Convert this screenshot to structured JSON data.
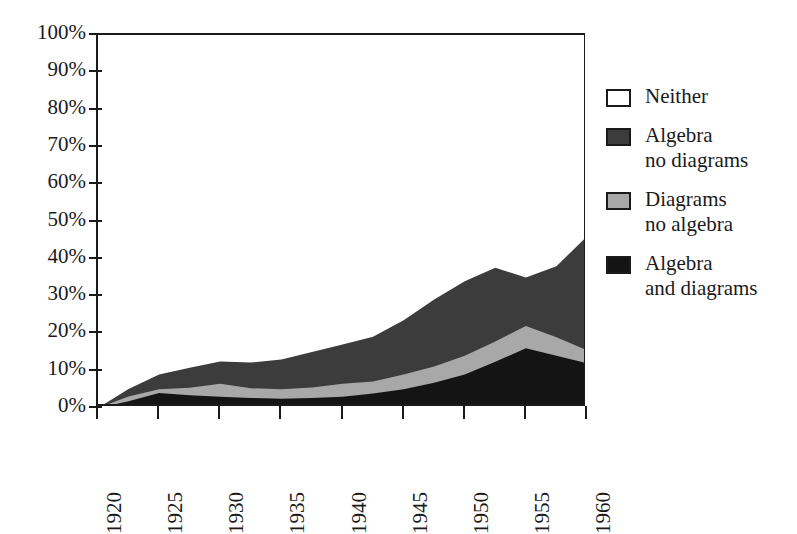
{
  "chart_data": {
    "type": "area",
    "stacked": true,
    "title": "",
    "subtitle": "",
    "xlabel": "",
    "ylabel": "",
    "xlim": [
      1920,
      1960
    ],
    "ylim": [
      0,
      100
    ],
    "grid": false,
    "legend_position": "right",
    "x": [
      1920,
      1922.5,
      1925,
      1927.5,
      1930,
      1932.5,
      1935,
      1937.5,
      1940,
      1942.5,
      1945,
      1947.5,
      1950,
      1952.5,
      1955,
      1957.5,
      1960
    ],
    "x_tick_labels": [
      "1920",
      "1925",
      "1930",
      "1935",
      "1940",
      "1945",
      "1950",
      "1955",
      "1960"
    ],
    "x_tick_values": [
      1920,
      1925,
      1930,
      1935,
      1940,
      1945,
      1950,
      1955,
      1960
    ],
    "y_tick_labels": [
      "0%",
      "10%",
      "20%",
      "30%",
      "40%",
      "50%",
      "60%",
      "70%",
      "80%",
      "90%",
      "100%"
    ],
    "y_tick_values": [
      0,
      10,
      20,
      30,
      40,
      50,
      60,
      70,
      80,
      90,
      100
    ],
    "series": [
      {
        "name": "Algebra and diagrams",
        "color": "#141414",
        "stack_order": 1,
        "values": [
          0,
          1.8,
          4.0,
          3.4,
          3.0,
          2.7,
          2.5,
          2.7,
          3.0,
          3.9,
          5.0,
          6.8,
          9.0,
          12.4,
          16.0,
          14.0,
          12.0
        ]
      },
      {
        "name": "Diagrams no algebra",
        "color": "#a8a8a8",
        "stack_order": 2,
        "values": [
          0,
          1.3,
          1.0,
          2.0,
          3.5,
          2.6,
          2.5,
          2.8,
          3.5,
          3.2,
          4.0,
          4.3,
          5.0,
          5.4,
          6.0,
          5.0,
          3.5
        ]
      },
      {
        "name": "Algebra no diagrams",
        "color": "#3c3c3c",
        "stack_order": 3,
        "values": [
          0,
          2.0,
          4.0,
          5.4,
          6.0,
          6.9,
          8.0,
          9.5,
          10.5,
          12.0,
          14.5,
          18.0,
          20.0,
          19.8,
          13.0,
          19.0,
          30.5
        ]
      },
      {
        "name": "Neither",
        "color": "#ffffff",
        "stack_order": 4,
        "values": [
          100,
          94.9,
          91.0,
          89.2,
          87.5,
          87.8,
          87.0,
          85.0,
          83.0,
          80.9,
          76.5,
          70.9,
          66.0,
          62.4,
          65.0,
          62.0,
          54.0
        ]
      }
    ],
    "cumulative_tops": {
      "algebra_and_diagrams": [
        0,
        1.8,
        4.0,
        3.4,
        3.0,
        2.7,
        2.5,
        2.7,
        3.0,
        3.9,
        5.0,
        6.8,
        9.0,
        12.4,
        16.0,
        14.0,
        12.0
      ],
      "plus_diagrams_no_algebra": [
        0,
        3.1,
        5.0,
        5.4,
        6.5,
        5.3,
        5.0,
        5.5,
        6.5,
        7.1,
        9.0,
        11.1,
        14.0,
        17.8,
        22.0,
        19.0,
        15.5
      ],
      "plus_algebra_no_diagrams": [
        0,
        5.1,
        9.0,
        10.8,
        12.5,
        12.2,
        13.0,
        15.0,
        17.0,
        19.1,
        23.5,
        29.1,
        34.0,
        37.6,
        35.0,
        38.0,
        46.0
      ]
    }
  },
  "axes": {
    "y_ticks": [
      {
        "label": "100%",
        "value": 100
      },
      {
        "label": "90%",
        "value": 90
      },
      {
        "label": "80%",
        "value": 80
      },
      {
        "label": "70%",
        "value": 70
      },
      {
        "label": "60%",
        "value": 60
      },
      {
        "label": "50%",
        "value": 50
      },
      {
        "label": "40%",
        "value": 40
      },
      {
        "label": "30%",
        "value": 30
      },
      {
        "label": "20%",
        "value": 20
      },
      {
        "label": "10%",
        "value": 10
      },
      {
        "label": "0%",
        "value": 0
      }
    ],
    "x_ticks": [
      {
        "label": "1920",
        "value": 1920
      },
      {
        "label": "1925",
        "value": 1925
      },
      {
        "label": "1930",
        "value": 1930
      },
      {
        "label": "1935",
        "value": 1935
      },
      {
        "label": "1940",
        "value": 1940
      },
      {
        "label": "1945",
        "value": 1945
      },
      {
        "label": "1950",
        "value": 1950
      },
      {
        "label": "1955",
        "value": 1955
      },
      {
        "label": "1960",
        "value": 1960
      }
    ]
  },
  "legend": {
    "items": [
      {
        "label": "Neither",
        "color": "#ffffff"
      },
      {
        "label": "Algebra\nno diagrams",
        "color": "#3c3c3c"
      },
      {
        "label": "Diagrams\nno algebra",
        "color": "#a8a8a8"
      },
      {
        "label": "Algebra\nand diagrams",
        "color": "#141414"
      }
    ]
  },
  "colors": {
    "background": "#ffffff",
    "axis": "#1a1a1a",
    "text": "#1a1a1a",
    "neither": "#ffffff",
    "algebra_no_diagrams": "#3c3c3c",
    "diagrams_no_algebra": "#a8a8a8",
    "algebra_and_diagrams": "#141414"
  }
}
